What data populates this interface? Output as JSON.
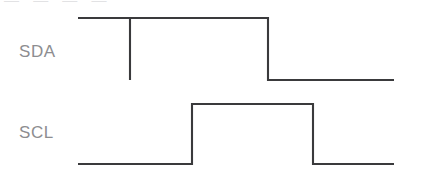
{
  "figure": {
    "type": "timing-diagram",
    "width": 427,
    "height": 178,
    "background_color": "#ffffff",
    "trace_color": "#3a3a3c",
    "label_color": "#8d8d90",
    "top_remnant_text": "— — — —",
    "signals": [
      {
        "name": "SDA",
        "label": "SDA",
        "label_x": 19,
        "label_y": 42,
        "high_y": 18,
        "low_y": 80,
        "start_x": 78,
        "end_x": 394,
        "initial_level": "high",
        "transitions": [
          {
            "x": 130,
            "edge": "falling"
          },
          {
            "x": 130,
            "edge": "rising"
          },
          {
            "x": 268,
            "edge": "falling"
          }
        ],
        "points": "78,18 130,18 130,80 130,18 268,18 268,80 394,80"
      },
      {
        "name": "SCL",
        "label": "SCL",
        "label_x": 19,
        "label_y": 123,
        "high_y": 104,
        "low_y": 164,
        "start_x": 78,
        "end_x": 394,
        "initial_level": "low",
        "transitions": [
          {
            "x": 192,
            "edge": "rising"
          },
          {
            "x": 313,
            "edge": "falling"
          }
        ],
        "points": "78,164 192,164 192,104 313,104 313,164 394,164"
      }
    ]
  }
}
